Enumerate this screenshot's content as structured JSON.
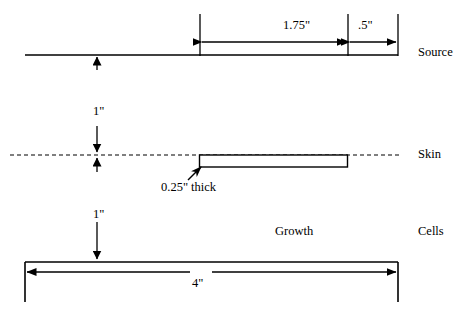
{
  "diagram": {
    "stroke_color": "#000000",
    "background_color": "#ffffff",
    "rows": [
      {
        "key": "source",
        "label": "Source"
      },
      {
        "key": "skin",
        "label": "Skin"
      },
      {
        "key": "cells",
        "label": "Cells"
      }
    ],
    "side_labels": {
      "source": "Source",
      "skin": "Skin",
      "cells": "Cells"
    },
    "dimensions": {
      "top_span_left": "1.75\"",
      "top_span_right": ".5\"",
      "source_to_skin": "1\"",
      "skin_to_cells": "1\"",
      "cells_width": "4\"",
      "growth_thickness": "0.25\" thick"
    },
    "annotations": {
      "growth": "Growth",
      "growth_thickness": "0.25\" thick"
    }
  }
}
